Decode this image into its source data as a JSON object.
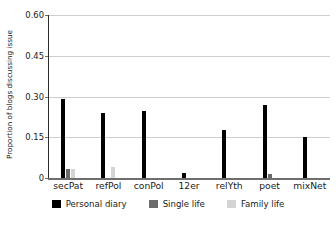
{
  "chart_data": {
    "type": "bar",
    "title": "",
    "xlabel": "",
    "ylabel": "Proportion of blogs discussing issue",
    "ylim": [
      0,
      0.6
    ],
    "yticks": [
      "0",
      "0.15",
      "0.30",
      "0.45",
      "0.60"
    ],
    "ytick_values": [
      0,
      0.15,
      0.3,
      0.45,
      0.6
    ],
    "grid": "horizontal",
    "legend_position": "bottom",
    "categories": [
      "secPat",
      "refPol",
      "conPol",
      "12er",
      "relYth",
      "poet",
      "mixNet"
    ],
    "series": [
      {
        "name": "Personal diary",
        "color": "#000000",
        "values": [
          0.29,
          0.24,
          0.245,
          0.018,
          0.175,
          0.27,
          0.15
        ]
      },
      {
        "name": "Single life",
        "color": "#6b6b6b",
        "values": [
          0.035,
          0,
          0,
          0,
          0,
          0.015,
          0
        ]
      },
      {
        "name": "Family life",
        "color": "#d4d4d4",
        "values": [
          0.035,
          0.04,
          0,
          0,
          0,
          0,
          0
        ]
      }
    ]
  },
  "axis": {
    "y_title": "Proportion of blogs discussing issue"
  },
  "colors": {
    "personal_diary": "#000000",
    "single_life": "#6b6b6b",
    "family_life": "#d4d4d4",
    "gridline": "#cfcfcf",
    "axis": "#6e6e6e",
    "background": "#ffffff"
  }
}
